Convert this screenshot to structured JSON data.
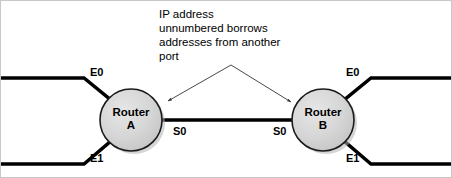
{
  "diagram": {
    "background_color": "#ffffff",
    "line_color": "#000000",
    "node_fill_color": "#d4d4d4",
    "node_stroke_color": "#1a1a1a",
    "shadow_color": "#b4b4b4",
    "arrow_color": "#333333",
    "annotation": {
      "text": "IP address\nunnumbered borrows\naddresses from another\nport",
      "lines": [
        "IP address",
        "unnumbered borrows",
        "addresses from another",
        "port"
      ]
    },
    "nodes": [
      {
        "id": "router-a",
        "name_line1": "Router",
        "name_line2": "A",
        "cx": 130,
        "cy": 119,
        "r": 31
      },
      {
        "id": "router-b",
        "name_line1": "Router",
        "name_line2": "B",
        "cx": 322,
        "cy": 119,
        "r": 31
      }
    ],
    "interface_labels": {
      "e0_left": "E0",
      "e1_left": "E1",
      "s0_left": "S0",
      "s0_right": "S0",
      "e0_right": "E0",
      "e1_right": "E1"
    },
    "links": [
      {
        "id": "ethernet-e0-left",
        "label": "E0",
        "type": "ethernet"
      },
      {
        "id": "ethernet-e1-left",
        "label": "E1",
        "type": "ethernet"
      },
      {
        "id": "serial-link",
        "label": "S0",
        "type": "serial"
      },
      {
        "id": "ethernet-e0-right",
        "label": "E0",
        "type": "ethernet"
      },
      {
        "id": "ethernet-e1-right",
        "label": "E1",
        "type": "ethernet"
      }
    ],
    "arrows": [
      {
        "id": "arrow-to-router-a-serial",
        "from_x": 230,
        "from_y": 64,
        "to_x": 167,
        "to_y": 100
      },
      {
        "id": "arrow-to-router-b-serial",
        "from_x": 230,
        "from_y": 64,
        "to_x": 290,
        "to_y": 101
      }
    ]
  }
}
